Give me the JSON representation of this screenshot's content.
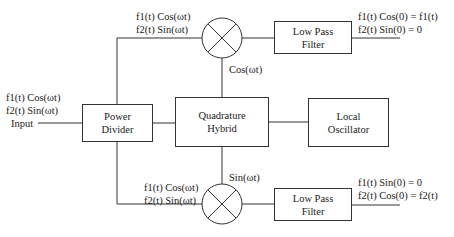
{
  "diagram": {
    "blocks": {
      "power_divider": {
        "line1": "Power",
        "line2": "Divider"
      },
      "quadrature_hybrid": {
        "line1": "Quadrature",
        "line2": "Hybrid"
      },
      "local_oscillator": {
        "line1": "Local",
        "line2": "Oscillator"
      },
      "lpf_top": {
        "line1": "Low Pass",
        "line2": "Filter"
      },
      "lpf_bottom": {
        "line1": "Low Pass",
        "line2": "Filter"
      }
    },
    "mixers": {
      "top": {
        "symbol": "mixer-x",
        "lo_label": "Cos(ωt)"
      },
      "bottom": {
        "symbol": "mixer-x",
        "lo_label": "Sin(ωt)"
      }
    },
    "labels": {
      "input": {
        "line1": "f1(t) Cos(ωt)",
        "line2": "f2(t) Sin(ωt)",
        "line3": "Input"
      },
      "top_branch": {
        "line1": "f1(t) Cos(ωt)",
        "line2": "f2(t) Sin(ωt)"
      },
      "bottom_branch": {
        "line1": "f1(t) Cos(ωt)",
        "line2": "f2(t) Sin(ωt)"
      },
      "top_output": {
        "line1": "f1(t) Cos(0) = f1(t)",
        "line2": "f2(t) Sin(0) = 0"
      },
      "bottom_output": {
        "line1": "f1(t) Sin(0) = 0",
        "line2": "f2(t) Cos(0) = f2(t)"
      }
    },
    "colors": {
      "line": "#333333",
      "background": "#ffffff",
      "text": "#222222"
    }
  }
}
